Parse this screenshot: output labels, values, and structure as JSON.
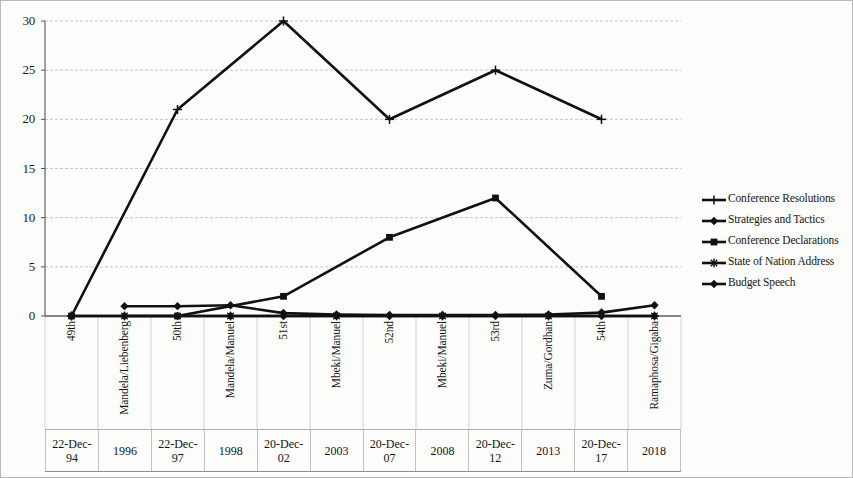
{
  "chart_data": {
    "type": "line",
    "title": "",
    "subtitle": "",
    "xlabel": "",
    "ylabel": "",
    "ylim": [
      0,
      30
    ],
    "y_ticks": [
      0,
      5,
      10,
      15,
      20,
      25,
      30
    ],
    "grid": true,
    "legend_position": "right",
    "categories": [
      "49th",
      "Mandela/Liebenberg",
      "50th",
      "Mandela/Manuel",
      "51st",
      "Mbeki/Manuel",
      "52nd",
      "Mbeki/Manuel",
      "53rd",
      "Zuma/Gordhan",
      "54th",
      "Ramaphosa/Gigaba"
    ],
    "secondary_axis_labels": [
      "22-Dec-94",
      "1996",
      "22-Dec-97",
      "1998",
      "20-Dec-02",
      "2003",
      "20-Dec-07",
      "2008",
      "20-Dec-12",
      "2013",
      "20-Dec-17",
      "2018"
    ],
    "series": [
      {
        "name": "Conference Resolutions",
        "marker": "plus",
        "values": [
          0,
          null,
          21,
          null,
          30,
          null,
          20,
          null,
          25,
          null,
          20,
          null
        ]
      },
      {
        "name": "Strategies and Tactics",
        "marker": "diamond",
        "values": [
          0,
          0,
          0,
          0,
          0,
          0,
          0,
          0,
          0,
          0,
          0,
          0
        ]
      },
      {
        "name": "Conference Declarations",
        "marker": "square",
        "values": [
          0,
          null,
          0,
          null,
          2,
          null,
          8,
          null,
          12,
          null,
          2,
          null
        ]
      },
      {
        "name": "State of Nation Address",
        "marker": "star",
        "values": [
          null,
          0,
          null,
          0,
          null,
          0,
          null,
          0,
          null,
          0,
          null,
          0
        ]
      },
      {
        "name": "Budget Speech",
        "marker": "diamond",
        "values": [
          null,
          1,
          1,
          1.1,
          0.3,
          0.15,
          0.1,
          0.1,
          0.1,
          0.15,
          0.35,
          1.1
        ]
      }
    ]
  },
  "axis": {
    "y_tick_labels": [
      "30",
      "25",
      "20",
      "15",
      "10",
      "5",
      "0"
    ]
  },
  "legend": {
    "items": [
      {
        "label": "Conference Resolutions",
        "marker": "plus"
      },
      {
        "label": "Strategies and Tactics",
        "marker": "diamond"
      },
      {
        "label": "Conference Declarations",
        "marker": "square"
      },
      {
        "label": "State of Nation Address",
        "marker": "star"
      },
      {
        "label": "Budget Speech",
        "marker": "diamond"
      }
    ]
  }
}
